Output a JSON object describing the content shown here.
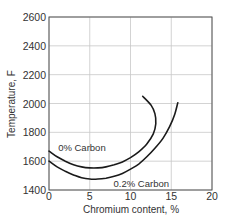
{
  "chart_data": {
    "type": "line",
    "title": "",
    "xlabel": "Chromium content, %",
    "ylabel": "Temperature, F",
    "xlim": [
      0,
      20
    ],
    "ylim": [
      1400,
      2600
    ],
    "xticks": [
      0,
      5,
      10,
      15,
      20
    ],
    "yticks": [
      1400,
      1600,
      1800,
      2000,
      2200,
      2400,
      2600
    ],
    "grid": true,
    "legend": "inline labels",
    "series": [
      {
        "name": "0% Carbon",
        "label_pos": [
          1,
          1690
        ],
        "points": [
          [
            0,
            1670
          ],
          [
            1,
            1630
          ],
          [
            2,
            1600
          ],
          [
            3,
            1575
          ],
          [
            4,
            1560
          ],
          [
            5,
            1553
          ],
          [
            6,
            1553
          ],
          [
            7,
            1560
          ],
          [
            8,
            1575
          ],
          [
            9,
            1595
          ],
          [
            10,
            1625
          ],
          [
            11,
            1665
          ],
          [
            12,
            1720
          ],
          [
            12.8,
            1790
          ],
          [
            13.1,
            1860
          ],
          [
            13.0,
            1930
          ],
          [
            12.5,
            1990
          ],
          [
            11.5,
            2050
          ]
        ]
      },
      {
        "name": "0.2% Carbon",
        "label_pos": [
          7.8,
          1440
        ],
        "points": [
          [
            0,
            1600
          ],
          [
            1,
            1560
          ],
          [
            2,
            1530
          ],
          [
            3,
            1505
          ],
          [
            4,
            1485
          ],
          [
            5,
            1476
          ],
          [
            6,
            1476
          ],
          [
            7,
            1482
          ],
          [
            8,
            1495
          ],
          [
            9,
            1515
          ],
          [
            10,
            1545
          ],
          [
            11,
            1580
          ],
          [
            12,
            1630
          ],
          [
            13,
            1690
          ],
          [
            14,
            1760
          ],
          [
            14.8,
            1840
          ],
          [
            15.4,
            1920
          ],
          [
            15.8,
            2005
          ]
        ]
      }
    ]
  }
}
